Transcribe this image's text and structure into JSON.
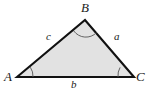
{
  "figure": {
    "kind": "triangle-diagram",
    "background_color": "#ffffff",
    "fill_color": "#e2e2e2",
    "stroke_color": "#111111",
    "arc_color": "#555555"
  },
  "vertices": [
    {
      "id": "A",
      "label": "A",
      "x": 17,
      "y": 77
    },
    {
      "id": "B",
      "label": "B",
      "x": 85,
      "y": 20
    },
    {
      "id": "C",
      "label": "C",
      "x": 134,
      "y": 77
    }
  ],
  "sides": [
    {
      "id": "a",
      "label": "a",
      "from": "B",
      "to": "C"
    },
    {
      "id": "b",
      "label": "b",
      "from": "A",
      "to": "C"
    },
    {
      "id": "c",
      "label": "c",
      "from": "A",
      "to": "B"
    }
  ],
  "angles": [
    {
      "at": "A",
      "marker": "arc"
    },
    {
      "at": "B",
      "marker": "arc"
    },
    {
      "at": "C",
      "marker": "arc"
    }
  ],
  "geometry": {
    "triangle_points": "17,77 85,20 134,77",
    "arc_A": "M 33,77 A 16,16 0 0 0 30.3,67.2",
    "arc_B": "M 73.8,31.0 A 15,15 0 0 0 96.6,32.6",
    "arc_C": "M 118,77 A 16,16 0 0 1 120.1,67.4"
  }
}
